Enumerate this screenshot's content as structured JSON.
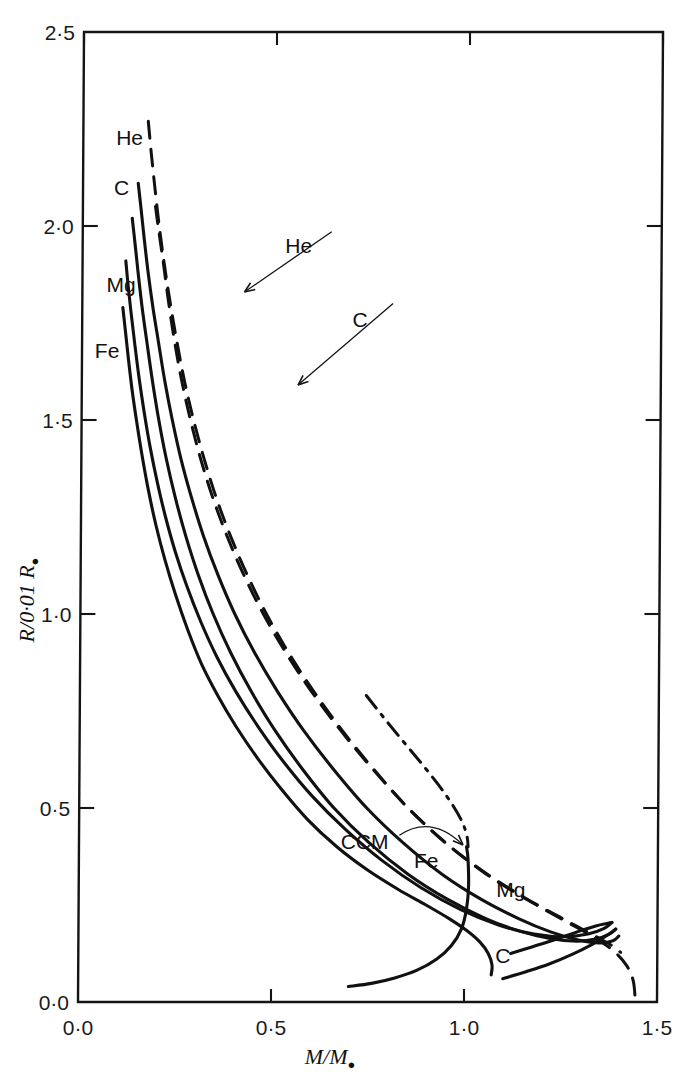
{
  "figure": {
    "background_color": "#ffffff",
    "line_color": "#111111",
    "frame": {
      "x_left_px": 78,
      "x_right_px": 657,
      "y_top_px": 32,
      "y_bottom_px": 1002
    }
  },
  "chart_data": {
    "type": "line",
    "title": "",
    "xlabel": "M/M⊙",
    "ylabel": "R/0·01 R⊙",
    "xlim": [
      0.0,
      1.5
    ],
    "ylim": [
      0.0,
      2.5
    ],
    "xticks": [
      "0·0",
      "0·5",
      "1·0",
      "1·5"
    ],
    "xtick_values": [
      0.0,
      0.5,
      1.0,
      1.5
    ],
    "yticks": [
      "0·0",
      "0·5",
      "1·0",
      "1·5",
      "2·0",
      "2·5"
    ],
    "ytick_values": [
      0.0,
      0.5,
      1.0,
      1.5,
      2.0,
      2.5
    ],
    "grid": false,
    "legend": "inline-curve-labels",
    "series": [
      {
        "name": "He",
        "style": "dashed",
        "label_positions": [
          {
            "text": "He",
            "x": 0.12,
            "y": 2.21
          },
          {
            "text": "He",
            "x": 0.56,
            "y": 1.93,
            "annotated": true
          }
        ],
        "points": [
          [
            0.168,
            2.27
          ],
          [
            0.176,
            2.19
          ],
          [
            0.186,
            2.1
          ],
          [
            0.198,
            2.0
          ],
          [
            0.212,
            1.9
          ],
          [
            0.228,
            1.8
          ],
          [
            0.246,
            1.7
          ],
          [
            0.266,
            1.6
          ],
          [
            0.29,
            1.5
          ],
          [
            0.318,
            1.4
          ],
          [
            0.35,
            1.3
          ],
          [
            0.388,
            1.2
          ],
          [
            0.432,
            1.1
          ],
          [
            0.482,
            1.0
          ],
          [
            0.54,
            0.9
          ],
          [
            0.606,
            0.8
          ],
          [
            0.68,
            0.7
          ],
          [
            0.762,
            0.6
          ],
          [
            0.852,
            0.5
          ],
          [
            0.95,
            0.41
          ],
          [
            1.055,
            0.33
          ],
          [
            1.16,
            0.265
          ],
          [
            1.255,
            0.212
          ],
          [
            1.33,
            0.17
          ],
          [
            1.385,
            0.133
          ],
          [
            1.42,
            0.095
          ],
          [
            1.438,
            0.055
          ],
          [
            1.444,
            0.0
          ]
        ]
      },
      {
        "name": "C-dashed",
        "display_name": "C",
        "style": "dashed",
        "label_positions": [
          {
            "text": "C",
            "x": 0.72,
            "y": 1.74,
            "annotated": true
          }
        ],
        "points": [
          [
            0.188,
            2.05
          ],
          [
            0.198,
            1.98
          ],
          [
            0.21,
            1.9
          ],
          [
            0.224,
            1.8
          ],
          [
            0.24,
            1.7
          ],
          [
            0.259,
            1.6
          ],
          [
            0.282,
            1.5
          ],
          [
            0.309,
            1.4
          ],
          [
            0.341,
            1.3
          ],
          [
            0.379,
            1.2
          ],
          [
            0.423,
            1.1
          ],
          [
            0.474,
            1.0
          ],
          [
            0.533,
            0.9
          ],
          [
            0.6,
            0.8
          ],
          [
            0.676,
            0.7
          ],
          [
            0.76,
            0.6
          ],
          [
            0.852,
            0.5
          ],
          [
            0.95,
            0.41
          ],
          [
            1.05,
            0.335
          ],
          [
            1.15,
            0.272
          ],
          [
            1.245,
            0.22
          ],
          [
            1.32,
            0.18
          ],
          [
            1.375,
            0.15
          ],
          [
            1.405,
            0.128
          ]
        ]
      },
      {
        "name": "He-solid",
        "display_name": "He",
        "style": "solid",
        "points": [
          [
            0.143,
            2.11
          ],
          [
            0.15,
            2.05
          ],
          [
            0.159,
            1.97
          ],
          [
            0.17,
            1.88
          ],
          [
            0.183,
            1.79
          ],
          [
            0.198,
            1.7
          ],
          [
            0.215,
            1.6
          ],
          [
            0.235,
            1.5
          ],
          [
            0.258,
            1.4
          ],
          [
            0.286,
            1.3
          ],
          [
            0.318,
            1.2
          ],
          [
            0.356,
            1.1
          ],
          [
            0.4,
            1.0
          ],
          [
            0.452,
            0.9
          ],
          [
            0.512,
            0.8
          ],
          [
            0.58,
            0.7
          ],
          [
            0.658,
            0.6
          ],
          [
            0.745,
            0.5
          ],
          [
            0.84,
            0.41
          ],
          [
            0.94,
            0.33
          ],
          [
            1.042,
            0.265
          ],
          [
            1.14,
            0.215
          ],
          [
            1.225,
            0.18
          ],
          [
            1.295,
            0.16
          ],
          [
            1.35,
            0.152
          ],
          [
            1.385,
            0.158
          ],
          [
            1.4,
            0.17
          ]
        ]
      },
      {
        "name": "C",
        "style": "solid",
        "label_positions": [
          {
            "text": "C",
            "x": 0.1,
            "y": 2.08
          },
          {
            "text": "C",
            "x": 1.1,
            "y": 0.1
          }
        ],
        "points": [
          [
            0.128,
            2.02
          ],
          [
            0.135,
            1.96
          ],
          [
            0.144,
            1.88
          ],
          [
            0.155,
            1.79
          ],
          [
            0.168,
            1.7
          ],
          [
            0.183,
            1.6
          ],
          [
            0.2,
            1.5
          ],
          [
            0.22,
            1.4
          ],
          [
            0.244,
            1.3
          ],
          [
            0.272,
            1.2
          ],
          [
            0.305,
            1.1
          ],
          [
            0.344,
            1.0
          ],
          [
            0.39,
            0.9
          ],
          [
            0.444,
            0.8
          ],
          [
            0.506,
            0.7
          ],
          [
            0.578,
            0.6
          ],
          [
            0.66,
            0.5
          ],
          [
            0.752,
            0.41
          ],
          [
            0.852,
            0.33
          ],
          [
            0.955,
            0.265
          ],
          [
            1.055,
            0.215
          ],
          [
            1.145,
            0.182
          ],
          [
            1.225,
            0.163
          ],
          [
            1.29,
            0.157
          ],
          [
            1.34,
            0.162
          ],
          [
            1.375,
            0.175
          ],
          [
            1.392,
            0.188
          ]
        ]
      },
      {
        "name": "Mg",
        "style": "solid",
        "label_positions": [
          {
            "text": "Mg",
            "x": 0.1,
            "y": 1.83
          },
          {
            "text": "Mg",
            "x": 1.12,
            "y": 0.27
          }
        ],
        "points": [
          [
            0.112,
            1.91
          ],
          [
            0.118,
            1.85
          ],
          [
            0.126,
            1.78
          ],
          [
            0.136,
            1.7
          ],
          [
            0.148,
            1.61
          ],
          [
            0.162,
            1.52
          ],
          [
            0.178,
            1.43
          ],
          [
            0.197,
            1.34
          ],
          [
            0.219,
            1.25
          ],
          [
            0.245,
            1.16
          ],
          [
            0.276,
            1.07
          ],
          [
            0.312,
            0.98
          ],
          [
            0.354,
            0.89
          ],
          [
            0.404,
            0.8
          ],
          [
            0.462,
            0.71
          ],
          [
            0.528,
            0.62
          ],
          [
            0.604,
            0.53
          ],
          [
            0.69,
            0.445
          ],
          [
            0.785,
            0.365
          ],
          [
            0.886,
            0.295
          ],
          [
            0.99,
            0.238
          ],
          [
            1.09,
            0.198
          ],
          [
            1.18,
            0.175
          ],
          [
            1.258,
            0.168
          ],
          [
            1.32,
            0.175
          ],
          [
            1.362,
            0.19
          ],
          [
            1.382,
            0.205
          ]
        ]
      },
      {
        "name": "Fe",
        "style": "solid",
        "label_positions": [
          {
            "text": "Fe",
            "x": 0.065,
            "y": 1.66
          },
          {
            "text": "Fe",
            "x": 0.9,
            "y": 0.345
          }
        ],
        "points": [
          [
            0.105,
            1.79
          ],
          [
            0.112,
            1.73
          ],
          [
            0.12,
            1.66
          ],
          [
            0.13,
            1.58
          ],
          [
            0.142,
            1.5
          ],
          [
            0.157,
            1.41
          ],
          [
            0.174,
            1.32
          ],
          [
            0.194,
            1.23
          ],
          [
            0.218,
            1.14
          ],
          [
            0.246,
            1.05
          ],
          [
            0.278,
            0.96
          ],
          [
            0.315,
            0.87
          ],
          [
            0.357,
            0.79
          ],
          [
            0.405,
            0.71
          ],
          [
            0.46,
            0.63
          ],
          [
            0.522,
            0.55
          ],
          [
            0.592,
            0.47
          ],
          [
            0.668,
            0.4
          ],
          [
            0.748,
            0.34
          ],
          [
            0.828,
            0.29
          ],
          [
            0.9,
            0.25
          ],
          [
            0.96,
            0.215
          ],
          [
            1.005,
            0.185
          ],
          [
            1.04,
            0.155
          ],
          [
            1.062,
            0.125
          ],
          [
            1.072,
            0.095
          ],
          [
            1.07,
            0.07
          ]
        ]
      },
      {
        "name": "CCM",
        "style": "dash-dot",
        "label_positions": [
          {
            "text": "CCM",
            "x": 0.74,
            "y": 0.395,
            "annotated": true
          }
        ],
        "points": [
          [
            0.742,
            0.79
          ],
          [
            0.79,
            0.73
          ],
          [
            0.838,
            0.672
          ],
          [
            0.886,
            0.615
          ],
          [
            0.93,
            0.56
          ],
          [
            0.966,
            0.51
          ],
          [
            0.992,
            0.465
          ],
          [
            1.005,
            0.428
          ],
          [
            1.008,
            0.4
          ]
        ]
      },
      {
        "name": "Fe-branch-lower",
        "display_name": "",
        "style": "solid",
        "points": [
          [
            0.7,
            0.04
          ],
          [
            0.76,
            0.048
          ],
          [
            0.82,
            0.062
          ],
          [
            0.878,
            0.082
          ],
          [
            0.928,
            0.11
          ],
          [
            0.966,
            0.145
          ],
          [
            0.992,
            0.188
          ],
          [
            1.005,
            0.24
          ],
          [
            1.01,
            0.3
          ],
          [
            1.008,
            0.37
          ],
          [
            1.004,
            0.4
          ]
        ]
      },
      {
        "name": "C-branch-lower",
        "display_name": "C",
        "style": "solid",
        "points": [
          [
            1.1,
            0.06
          ],
          [
            1.16,
            0.078
          ],
          [
            1.22,
            0.098
          ],
          [
            1.278,
            0.122
          ],
          [
            1.33,
            0.148
          ],
          [
            1.37,
            0.172
          ],
          [
            1.392,
            0.188
          ]
        ]
      },
      {
        "name": "Mg-branch-lower",
        "display_name": "Mg",
        "style": "solid",
        "points": [
          [
            1.12,
            0.125
          ],
          [
            1.175,
            0.142
          ],
          [
            1.232,
            0.16
          ],
          [
            1.29,
            0.18
          ],
          [
            1.34,
            0.196
          ],
          [
            1.372,
            0.203
          ],
          [
            1.382,
            0.205
          ]
        ]
      }
    ],
    "annotations": [
      {
        "label": "He",
        "from": [
          0.645,
          1.985
        ],
        "to": [
          0.42,
          1.83
        ]
      },
      {
        "label": "C",
        "from": [
          0.805,
          1.8
        ],
        "to": [
          0.56,
          1.59
        ]
      },
      {
        "label": "CCM",
        "from": [
          0.83,
          0.43
        ],
        "to": [
          0.995,
          0.405
        ]
      }
    ]
  }
}
